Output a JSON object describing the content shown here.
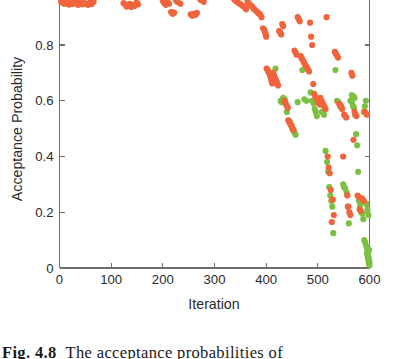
{
  "figure": {
    "caption_label": "Fig. 4.8",
    "caption_body": "The acceptance probabilities of"
  },
  "chart_data": {
    "type": "scatter",
    "title": "",
    "xlabel": "Iteration",
    "ylabel": "Acceptance Probability",
    "xlim": [
      0,
      600
    ],
    "ylim": [
      0,
      1.0
    ],
    "xticks": [
      0,
      100,
      200,
      300,
      400,
      500,
      600
    ],
    "xticklabels": [
      "0",
      "100",
      "200",
      "300",
      "400",
      "500",
      "600"
    ],
    "yticks": [
      0,
      0.2,
      0.4,
      0.6,
      0.8
    ],
    "yticklabels": [
      "0",
      "0.2",
      "0.4",
      "0.6",
      "0.8"
    ],
    "grid": false,
    "legend": null,
    "note": "Top of plot box is cropped by the figure crop; points near probability 1.0 are clipped.",
    "marker_radius_px": 3.1,
    "series": [
      {
        "name": "orange-series",
        "color": "#F0643C",
        "points": [
          [
            3,
            0.955
          ],
          [
            6,
            0.952
          ],
          [
            9,
            0.948
          ],
          [
            12,
            0.958
          ],
          [
            15,
            0.95
          ],
          [
            18,
            0.945
          ],
          [
            21,
            0.953
          ],
          [
            24,
            0.947
          ],
          [
            27,
            0.951
          ],
          [
            30,
            0.949
          ],
          [
            33,
            0.955
          ],
          [
            36,
            0.944
          ],
          [
            40,
            0.95
          ],
          [
            44,
            0.946
          ],
          [
            47,
            0.952
          ],
          [
            51,
            0.948
          ],
          [
            55,
            0.944
          ],
          [
            58,
            0.951
          ],
          [
            62,
            0.947
          ],
          [
            66,
            0.955
          ],
          [
            70,
            0.98
          ],
          [
            74,
            0.985
          ],
          [
            78,
            0.975
          ],
          [
            82,
            0.99
          ],
          [
            86,
            0.982
          ],
          [
            90,
            0.978
          ],
          [
            94,
            0.988
          ],
          [
            98,
            0.972
          ],
          [
            103,
            0.985
          ],
          [
            107,
            0.98
          ],
          [
            112,
            0.976
          ],
          [
            116,
            0.99
          ],
          [
            120,
            0.984
          ],
          [
            124,
            0.95
          ],
          [
            127,
            0.945
          ],
          [
            130,
            0.938
          ],
          [
            133,
            0.942
          ],
          [
            136,
            0.948
          ],
          [
            139,
            0.936
          ],
          [
            142,
            0.944
          ],
          [
            145,
            0.94
          ],
          [
            149,
            0.952
          ],
          [
            152,
            0.946
          ],
          [
            156,
            0.985
          ],
          [
            160,
            0.99
          ],
          [
            164,
            0.978
          ],
          [
            168,
            0.986
          ],
          [
            172,
            0.982
          ],
          [
            176,
            0.99
          ],
          [
            180,
            0.975
          ],
          [
            184,
            0.988
          ],
          [
            188,
            0.984
          ],
          [
            192,
            0.98
          ],
          [
            196,
            0.986
          ],
          [
            200,
            0.958
          ],
          [
            203,
            0.95
          ],
          [
            206,
            0.944
          ],
          [
            209,
            0.955
          ],
          [
            212,
            0.948
          ],
          [
            216,
            0.918
          ],
          [
            219,
            0.912
          ],
          [
            222,
            0.916
          ],
          [
            225,
            0.962
          ],
          [
            228,
            0.955
          ],
          [
            231,
            0.97
          ],
          [
            234,
            0.948
          ],
          [
            238,
            0.985
          ],
          [
            242,
            0.99
          ],
          [
            246,
            0.982
          ],
          [
            250,
            0.976
          ],
          [
            254,
            0.91
          ],
          [
            257,
            0.905
          ],
          [
            260,
            0.912
          ],
          [
            263,
            0.908
          ],
          [
            266,
            0.915
          ],
          [
            270,
            0.97
          ],
          [
            273,
            0.962
          ],
          [
            276,
            0.978
          ],
          [
            279,
            0.955
          ],
          [
            283,
            0.985
          ],
          [
            287,
            0.99
          ],
          [
            291,
            0.98
          ],
          [
            295,
            0.986
          ],
          [
            299,
            0.978
          ],
          [
            303,
            0.99
          ],
          [
            307,
            0.984
          ],
          [
            311,
            0.988
          ],
          [
            315,
            0.98
          ],
          [
            319,
            0.975
          ],
          [
            323,
            0.985
          ],
          [
            327,
            0.99
          ],
          [
            331,
            0.978
          ],
          [
            335,
            0.97
          ],
          [
            339,
            0.962
          ],
          [
            343,
            0.955
          ],
          [
            347,
            0.95
          ],
          [
            351,
            0.945
          ],
          [
            355,
            0.94
          ],
          [
            358,
            0.935
          ],
          [
            361,
            0.928
          ],
          [
            364,
            0.955
          ],
          [
            367,
            0.948
          ],
          [
            370,
            0.942
          ],
          [
            373,
            0.938
          ],
          [
            376,
            0.93
          ],
          [
            379,
            0.925
          ],
          [
            382,
            0.92
          ],
          [
            385,
            0.914
          ],
          [
            388,
            0.91
          ],
          [
            391,
            0.9
          ],
          [
            394,
            0.86
          ],
          [
            396,
            0.855
          ],
          [
            398,
            0.845
          ],
          [
            399,
            0.838
          ],
          [
            400,
            0.83
          ],
          [
            401,
            0.715
          ],
          [
            403,
            0.71
          ],
          [
            404,
            0.705
          ],
          [
            406,
            0.7
          ],
          [
            407,
            0.695
          ],
          [
            408,
            0.688
          ],
          [
            409,
            0.682
          ],
          [
            410,
            0.675
          ],
          [
            411,
            0.668
          ],
          [
            412,
            0.662
          ],
          [
            413,
            0.7
          ],
          [
            415,
            0.693
          ],
          [
            416,
            0.686
          ],
          [
            418,
            0.678
          ],
          [
            420,
            0.67
          ],
          [
            421,
            0.663
          ],
          [
            423,
            0.655
          ],
          [
            425,
            0.85
          ],
          [
            427,
            0.845
          ],
          [
            429,
            0.838
          ],
          [
            431,
            0.875
          ],
          [
            433,
            0.868
          ],
          [
            435,
            0.6
          ],
          [
            437,
            0.594
          ],
          [
            438,
            0.588
          ],
          [
            440,
            0.582
          ],
          [
            442,
            0.575
          ],
          [
            443,
            0.53
          ],
          [
            445,
            0.524
          ],
          [
            446,
            0.518
          ],
          [
            448,
            0.512
          ],
          [
            450,
            0.506
          ],
          [
            451,
            0.5
          ],
          [
            453,
            0.495
          ],
          [
            455,
            0.78
          ],
          [
            457,
            0.772
          ],
          [
            459,
            0.765
          ],
          [
            461,
            0.9
          ],
          [
            463,
            0.893
          ],
          [
            465,
            0.885
          ],
          [
            467,
            0.76
          ],
          [
            469,
            0.752
          ],
          [
            471,
            0.745
          ],
          [
            473,
            0.738
          ],
          [
            475,
            0.73
          ],
          [
            477,
            0.725
          ],
          [
            479,
            0.718
          ],
          [
            481,
            0.712
          ],
          [
            483,
            0.705
          ],
          [
            485,
            0.88
          ],
          [
            487,
            0.83
          ],
          [
            489,
            0.8
          ],
          [
            491,
            0.66
          ],
          [
            493,
            0.625
          ],
          [
            495,
            0.615
          ],
          [
            497,
            0.608
          ],
          [
            499,
            0.6
          ],
          [
            501,
            0.595
          ],
          [
            503,
            0.588
          ],
          [
            505,
            0.61
          ],
          [
            507,
            0.6
          ],
          [
            509,
            0.592
          ],
          [
            511,
            0.585
          ],
          [
            513,
            0.578
          ],
          [
            515,
            0.57
          ],
          [
            517,
            0.9
          ],
          [
            519,
            0.4
          ],
          [
            521,
            0.36
          ],
          [
            523,
            0.34
          ],
          [
            525,
            0.28
          ],
          [
            527,
            0.165
          ],
          [
            529,
            0.245
          ],
          [
            531,
            0.19
          ],
          [
            533,
            0.775
          ],
          [
            535,
            0.768
          ],
          [
            537,
            0.762
          ],
          [
            539,
            0.755
          ],
          [
            541,
            0.59
          ],
          [
            543,
            0.585
          ],
          [
            545,
            0.58
          ],
          [
            547,
            0.57
          ],
          [
            549,
            0.4
          ],
          [
            551,
            0.55
          ],
          [
            553,
            0.545
          ],
          [
            555,
            0.54
          ],
          [
            557,
            0.26
          ],
          [
            559,
            0.22
          ],
          [
            561,
            0.2
          ],
          [
            563,
            0.19
          ],
          [
            565,
            0.7
          ],
          [
            567,
            0.69
          ],
          [
            569,
            0.46
          ],
          [
            571,
            0.56
          ],
          [
            573,
            0.55
          ],
          [
            575,
            0.545
          ],
          [
            577,
            0.26
          ],
          [
            579,
            0.255
          ],
          [
            581,
            0.21
          ],
          [
            583,
            0.205
          ],
          [
            585,
            0.25
          ],
          [
            587,
            0.245
          ],
          [
            589,
            0.24
          ],
          [
            591,
            0.56
          ],
          [
            593,
            0.555
          ],
          [
            595,
            0.55
          ]
        ]
      },
      {
        "name": "green-series",
        "color": "#7CC043",
        "points": [
          [
            418,
            0.715
          ],
          [
            428,
            0.6
          ],
          [
            430,
            0.595
          ],
          [
            433,
            0.61
          ],
          [
            436,
            0.604
          ],
          [
            440,
            0.56
          ],
          [
            443,
            0.53
          ],
          [
            445,
            0.525
          ],
          [
            447,
            0.52
          ],
          [
            449,
            0.51
          ],
          [
            451,
            0.5
          ],
          [
            453,
            0.492
          ],
          [
            455,
            0.485
          ],
          [
            457,
            0.478
          ],
          [
            461,
            0.595
          ],
          [
            470,
            0.71
          ],
          [
            474,
            0.605
          ],
          [
            478,
            0.6
          ],
          [
            486,
            0.63
          ],
          [
            489,
            0.6
          ],
          [
            492,
            0.59
          ],
          [
            494,
            0.57
          ],
          [
            496,
            0.56
          ],
          [
            498,
            0.545
          ],
          [
            500,
            0.6
          ],
          [
            503,
            0.595
          ],
          [
            506,
            0.585
          ],
          [
            508,
            0.56
          ],
          [
            512,
            0.55
          ],
          [
            515,
            0.42
          ],
          [
            518,
            0.38
          ],
          [
            520,
            0.345
          ],
          [
            522,
            0.29
          ],
          [
            524,
            0.26
          ],
          [
            526,
            0.24
          ],
          [
            528,
            0.22
          ],
          [
            530,
            0.125
          ],
          [
            534,
            0.71
          ],
          [
            537,
            0.6
          ],
          [
            540,
            0.595
          ],
          [
            543,
            0.58
          ],
          [
            546,
            0.575
          ],
          [
            549,
            0.3
          ],
          [
            551,
            0.29
          ],
          [
            553,
            0.285
          ],
          [
            556,
            0.27
          ],
          [
            558,
            0.22
          ],
          [
            560,
            0.16
          ],
          [
            563,
            0.6
          ],
          [
            566,
            0.595
          ],
          [
            568,
            0.58
          ],
          [
            570,
            0.575
          ],
          [
            572,
            0.55
          ],
          [
            574,
            0.48
          ],
          [
            576,
            0.44
          ],
          [
            578,
            0.345
          ],
          [
            580,
            0.24
          ],
          [
            582,
            0.225
          ],
          [
            584,
            0.2
          ],
          [
            586,
            0.195
          ],
          [
            588,
            0.175
          ],
          [
            590,
            0.1
          ],
          [
            592,
            0.09
          ],
          [
            594,
            0.075
          ],
          [
            596,
            0.06
          ],
          [
            597,
            0.05
          ],
          [
            598,
            0.04
          ],
          [
            599,
            0.03
          ],
          [
            600,
            0.02
          ],
          [
            600,
            0.01
          ],
          [
            599,
            0.015
          ],
          [
            598,
            0.025
          ],
          [
            597,
            0.035
          ],
          [
            596,
            0.045
          ],
          [
            595,
            0.055
          ],
          [
            599,
            0.065
          ],
          [
            598,
            0.19
          ],
          [
            596,
            0.21
          ],
          [
            594,
            0.23
          ],
          [
            593,
            0.6
          ],
          [
            591,
            0.58
          ],
          [
            589,
            0.56
          ],
          [
            566,
            0.62
          ],
          [
            569,
            0.615
          ],
          [
            571,
            0.61
          ]
        ]
      }
    ]
  }
}
